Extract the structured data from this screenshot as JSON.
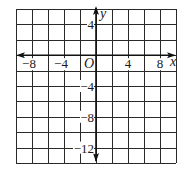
{
  "figure": {
    "type": "coordinate-grid",
    "x_axis": {
      "name": "x",
      "min": -10,
      "max": 10,
      "grid_step": 2,
      "tick_labels": [
        {
          "value": -8,
          "text": "−8"
        },
        {
          "value": -4,
          "text": "−4"
        },
        {
          "value": 4,
          "text": "4"
        },
        {
          "value": 8,
          "text": "8"
        }
      ]
    },
    "y_axis": {
      "name": "y",
      "min": -14,
      "max": 6,
      "grid_step": 2,
      "tick_labels": [
        {
          "value": 4,
          "text": "4"
        },
        {
          "value": -4,
          "text": "−4"
        },
        {
          "value": -8,
          "text": "−8"
        },
        {
          "value": -12,
          "text": "−12"
        }
      ]
    },
    "origin_label": "O",
    "colors": {
      "grid": "#2a2a2a",
      "axis": "#111111",
      "background": "#ffffff",
      "text": "#1a1a1a"
    }
  }
}
